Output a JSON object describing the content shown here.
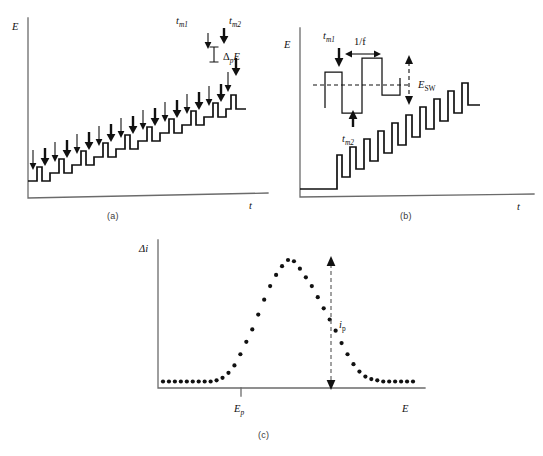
{
  "figure": {
    "panels": [
      "a",
      "b",
      "c"
    ]
  },
  "captions": {
    "a": "(a)",
    "b": "(b)",
    "c": "(c)"
  },
  "panel_a": {
    "y_axis_label": "E",
    "x_axis_label": "t",
    "annotations": {
      "tm1": "t",
      "tm1_sub": "m1",
      "tm2": "t",
      "tm2_sub": "m2",
      "step_height_delta": "Δ",
      "step_height_sub": "p",
      "step_height_var": "E"
    }
  },
  "panel_b": {
    "y_axis_label": "E",
    "x_axis_label": "t",
    "annotations": {
      "tm1": "t",
      "tm1_sub": "m1",
      "tm2": "t",
      "tm2_sub": "m2",
      "period": "1/f",
      "amplitude": "E",
      "amplitude_sub": "SW"
    }
  },
  "panel_c": {
    "y_axis_label": "Δi",
    "x_axis_label": "E",
    "peak_label": "E",
    "peak_label_sub": "p",
    "current_label": "i",
    "current_label_sub": "p"
  },
  "chart_data": {
    "type": "scatter",
    "title": "",
    "xlabel": "E",
    "ylabel": "Δi",
    "peak_potential": "E_p",
    "peak_current": "i_p",
    "x": [
      0,
      1,
      2,
      3,
      4,
      5,
      6,
      7,
      8,
      9,
      10,
      11,
      12,
      13,
      14,
      15,
      16,
      17,
      18,
      19,
      20,
      21,
      22,
      23,
      24,
      25,
      26,
      27,
      28,
      29,
      30,
      31,
      32,
      33,
      34,
      35,
      36,
      37,
      38,
      39,
      40,
      41,
      42
    ],
    "values": [
      0.02,
      0.02,
      0.02,
      0.02,
      0.02,
      0.02,
      0.02,
      0.02,
      0.02,
      0.03,
      0.05,
      0.09,
      0.15,
      0.24,
      0.34,
      0.44,
      0.56,
      0.68,
      0.79,
      0.88,
      0.95,
      1.0,
      0.99,
      0.93,
      0.86,
      0.79,
      0.7,
      0.61,
      0.52,
      0.43,
      0.33,
      0.24,
      0.16,
      0.1,
      0.06,
      0.04,
      0.03,
      0.02,
      0.02,
      0.02,
      0.02,
      0.02,
      0.02
    ],
    "grid": false,
    "legend": false
  }
}
